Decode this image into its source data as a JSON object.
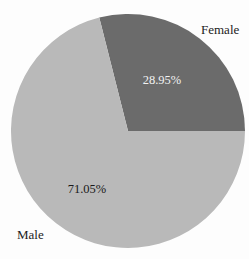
{
  "chart_data": {
    "type": "pie",
    "title": "",
    "labels": [
      "Female",
      "Male"
    ],
    "values": [
      28.95,
      71.05
    ],
    "pct_labels": [
      "28.95%",
      "71.05%"
    ],
    "slice_colors": [
      "#6b6b6b",
      "#b9b9b9"
    ],
    "pct_label_colors": [
      "#f2f2f2",
      "#1a1a1a"
    ],
    "category_label_color": "#1c1c1c",
    "background_color": "#fdfdfd",
    "start_angle_deg": 0,
    "direction": "counterclockwise",
    "legend": "none",
    "gridlines": "none"
  }
}
